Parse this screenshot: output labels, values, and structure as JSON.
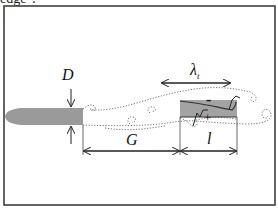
{
  "caption_fragment": "edge\".",
  "labels": {
    "D": "D",
    "G": "G",
    "l": "l",
    "lambda": "λ",
    "lambda_sub": "t",
    "minus": "-",
    "plus": "+"
  },
  "colors": {
    "frame": "#333333",
    "body_fill": "#9a9a9a",
    "plate_fill": "#a3a3a3",
    "wake": "#777777"
  }
}
